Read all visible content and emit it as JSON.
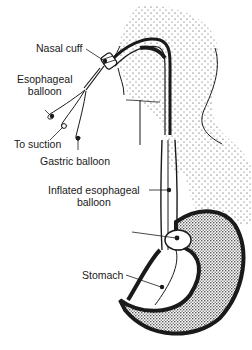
{
  "diagram": {
    "colors": {
      "ink": "#1a1a1a",
      "background": "#ffffff",
      "stipple": "#333333"
    },
    "labels": {
      "nasal_cuff": "Nasal cuff",
      "esophageal_balloon_line1": "Esophageal",
      "esophageal_balloon_line2": "balloon",
      "to_suction": "To suction",
      "gastric_balloon": "Gastric balloon",
      "inflated_esophageal_line1": "Inflated esophageal",
      "inflated_esophageal_line2": "balloon",
      "stomach": "Stomach"
    }
  }
}
